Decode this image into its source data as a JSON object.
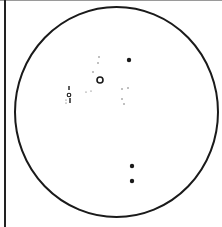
{
  "diagram": {
    "type": "circular-field-of-view",
    "colors": {
      "background": "#ffffff",
      "ink": "#1a1a1a",
      "faint": "#555555",
      "top_border": "#9a9a9a"
    },
    "boundary": {
      "cx": 116.5,
      "cy": 112,
      "rx": 101.5,
      "ry": 105,
      "stroke_width": 2
    },
    "marks": [
      {
        "kind": "large-dot",
        "x": 129,
        "y": 60,
        "r": 2.2
      },
      {
        "kind": "ring",
        "x": 100,
        "y": 80,
        "r": 3,
        "stroke_width": 1.6
      },
      {
        "kind": "large-dot",
        "x": 132,
        "y": 166,
        "r": 2.2
      },
      {
        "kind": "large-dot",
        "x": 132,
        "y": 181,
        "r": 2.2
      },
      {
        "kind": "small-ring",
        "x": 69,
        "y": 95,
        "r": 1.8,
        "stroke_width": 1.1
      },
      {
        "kind": "tick",
        "x": 69,
        "y": 86,
        "h": 4
      },
      {
        "kind": "tick",
        "x": 70,
        "y": 98,
        "h": 5
      },
      {
        "kind": "small-dot",
        "x": 66,
        "y": 100,
        "r": 0.6
      },
      {
        "kind": "small-dot",
        "x": 66,
        "y": 103,
        "r": 0.6
      },
      {
        "kind": "small-dot",
        "x": 99,
        "y": 57,
        "r": 0.7
      },
      {
        "kind": "small-dot",
        "x": 98,
        "y": 63,
        "r": 0.7
      },
      {
        "kind": "small-dot",
        "x": 93,
        "y": 72,
        "r": 0.7
      },
      {
        "kind": "small-dot",
        "x": 86,
        "y": 92,
        "r": 0.6
      },
      {
        "kind": "small-dot",
        "x": 91,
        "y": 91,
        "r": 0.6
      },
      {
        "kind": "small-dot",
        "x": 122,
        "y": 89,
        "r": 0.7
      },
      {
        "kind": "small-dot",
        "x": 128,
        "y": 88,
        "r": 0.7
      },
      {
        "kind": "small-dot",
        "x": 122,
        "y": 99,
        "r": 0.7
      },
      {
        "kind": "small-dot",
        "x": 124,
        "y": 104,
        "r": 0.7
      }
    ]
  }
}
